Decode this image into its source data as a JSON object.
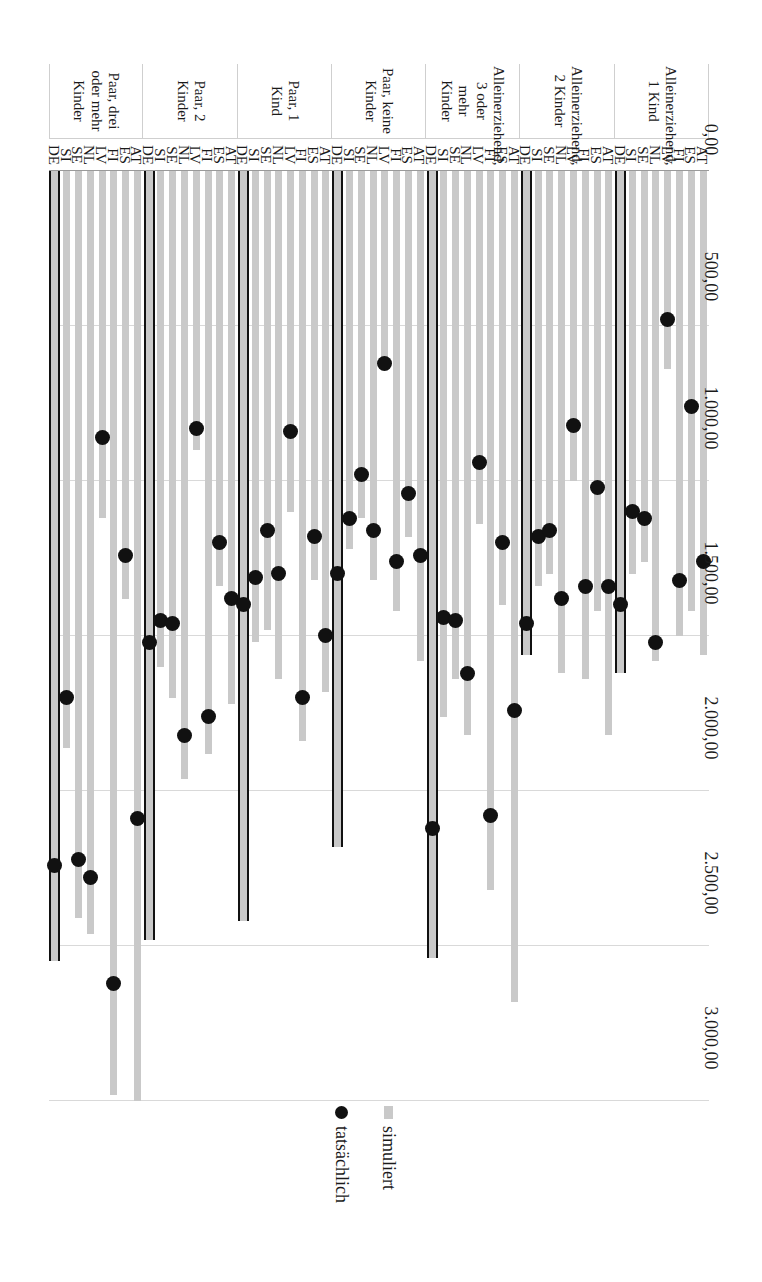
{
  "chart_data": {
    "type": "bar",
    "title": "",
    "xlabel": "",
    "ylabel": "",
    "orientation": "horizontal-rotated-90",
    "xlim": [
      0,
      3000
    ],
    "grid": true,
    "axis_ticks": [
      "3.000,00",
      "2.500,00",
      "2.000,00",
      "1.500,00",
      "1.000,00",
      "500,00",
      "0,00"
    ],
    "axis_tick_values": [
      3000,
      2500,
      2000,
      1500,
      1000,
      500,
      0
    ],
    "legend_position": "right",
    "legend": [
      {
        "label": "simuliert",
        "marker": "square",
        "color": "#c9c9c9"
      },
      {
        "label": "tatsächlich",
        "marker": "circle",
        "color": "#111111"
      }
    ],
    "series": [
      {
        "name": "simuliert",
        "type": "bar"
      },
      {
        "name": "tatsächlich",
        "type": "scatter"
      }
    ],
    "countries": [
      "DE",
      "SI",
      "SE",
      "NL",
      "LV",
      "FI",
      "ES",
      "AT"
    ],
    "groups": [
      {
        "label": "Paar, drei oder mehr Kinder",
        "rows": [
          {
            "country": "DE",
            "simuliert": 2550,
            "tatsaechlich": 2240,
            "highlight": true
          },
          {
            "country": "SI",
            "simuliert": 1860,
            "tatsaechlich": 1700
          },
          {
            "country": "SE",
            "simuliert": 2410,
            "tatsaechlich": 2220
          },
          {
            "country": "NL",
            "simuliert": 2460,
            "tatsaechlich": 2280
          },
          {
            "country": "LV",
            "simuliert": 1120,
            "tatsaechlich": 860
          },
          {
            "country": "FI",
            "simuliert": 2980,
            "tatsaechlich": 2620
          },
          {
            "country": "ES",
            "simuliert": 1380,
            "tatsaechlich": 1240
          },
          {
            "country": "AT",
            "simuliert": 3000,
            "tatsaechlich": 2090
          }
        ]
      },
      {
        "label": "Paar, 2 Kinder",
        "rows": [
          {
            "country": "DE",
            "simuliert": 2480,
            "tatsaechlich": 1520,
            "highlight": true
          },
          {
            "country": "SI",
            "simuliert": 1600,
            "tatsaechlich": 1450
          },
          {
            "country": "SE",
            "simuliert": 1700,
            "tatsaechlich": 1460
          },
          {
            "country": "NL",
            "simuliert": 1960,
            "tatsaechlich": 1820
          },
          {
            "country": "LV",
            "simuliert": 900,
            "tatsaechlich": 830
          },
          {
            "country": "FI",
            "simuliert": 1880,
            "tatsaechlich": 1760
          },
          {
            "country": "ES",
            "simuliert": 1340,
            "tatsaechlich": 1200
          },
          {
            "country": "AT",
            "simuliert": 1720,
            "tatsaechlich": 1380
          }
        ]
      },
      {
        "label": "Paar, 1 Kind",
        "rows": [
          {
            "country": "DE",
            "simuliert": 2420,
            "tatsaechlich": 1400,
            "highlight": true
          },
          {
            "country": "SI",
            "simuliert": 1520,
            "tatsaechlich": 1310
          },
          {
            "country": "SE",
            "simuliert": 1480,
            "tatsaechlich": 1160
          },
          {
            "country": "NL",
            "simuliert": 1640,
            "tatsaechlich": 1300
          },
          {
            "country": "LV",
            "simuliert": 1100,
            "tatsaechlich": 840
          },
          {
            "country": "FI",
            "simuliert": 1840,
            "tatsaechlich": 1700
          },
          {
            "country": "ES",
            "simuliert": 1320,
            "tatsaechlich": 1180
          },
          {
            "country": "AT",
            "simuliert": 1680,
            "tatsaechlich": 1500
          }
        ]
      },
      {
        "label": "Paar, keine Kinder",
        "rows": [
          {
            "country": "DE",
            "simuliert": 2180,
            "tatsaechlich": 1300,
            "highlight": true
          },
          {
            "country": "SI",
            "simuliert": 1220,
            "tatsaechlich": 1120
          },
          {
            "country": "SE",
            "simuliert": 1120,
            "tatsaechlich": 980
          },
          {
            "country": "NL",
            "simuliert": 1320,
            "tatsaechlich": 1160
          },
          {
            "country": "LV",
            "simuliert": 640,
            "tatsaechlich": 620
          },
          {
            "country": "FI",
            "simuliert": 1420,
            "tatsaechlich": 1260
          },
          {
            "country": "ES",
            "simuliert": 1180,
            "tatsaechlich": 1040
          },
          {
            "country": "AT",
            "simuliert": 1580,
            "tatsaechlich": 1240
          }
        ]
      },
      {
        "label": "Alleinerziehend, 3 oder mehr Kinder",
        "rows": [
          {
            "country": "DE",
            "simuliert": 2540,
            "tatsaechlich": 2120,
            "highlight": true
          },
          {
            "country": "SI",
            "simuliert": 1760,
            "tatsaechlich": 1440
          },
          {
            "country": "SE",
            "simuliert": 1640,
            "tatsaechlich": 1450
          },
          {
            "country": "NL",
            "simuliert": 1820,
            "tatsaechlich": 1620
          },
          {
            "country": "LV",
            "simuliert": 1140,
            "tatsaechlich": 940
          },
          {
            "country": "FI",
            "simuliert": 2320,
            "tatsaechlich": 2080
          },
          {
            "country": "ES",
            "simuliert": 1400,
            "tatsaechlich": 1200
          },
          {
            "country": "AT",
            "simuliert": 2680,
            "tatsaechlich": 1740
          }
        ]
      },
      {
        "label": "Alleinerziehend, 2 Kinder",
        "rows": [
          {
            "country": "DE",
            "simuliert": 1560,
            "tatsaechlich": 1460,
            "highlight": true
          },
          {
            "country": "SI",
            "simuliert": 1340,
            "tatsaechlich": 1180
          },
          {
            "country": "SE",
            "simuliert": 1300,
            "tatsaechlich": 1160
          },
          {
            "country": "NL",
            "simuliert": 1620,
            "tatsaechlich": 1380
          },
          {
            "country": "LV",
            "simuliert": 1000,
            "tatsaechlich": 820
          },
          {
            "country": "FI",
            "simuliert": 1640,
            "tatsaechlich": 1340
          },
          {
            "country": "ES",
            "simuliert": 1420,
            "tatsaechlich": 1020
          },
          {
            "country": "AT",
            "simuliert": 1820,
            "tatsaechlich": 1340
          }
        ]
      },
      {
        "label": "Alleinerziehend, 1 Kind",
        "rows": [
          {
            "country": "DE",
            "simuliert": 1620,
            "tatsaechlich": 1400,
            "highlight": true
          },
          {
            "country": "SI",
            "simuliert": 1300,
            "tatsaechlich": 1100
          },
          {
            "country": "SE",
            "simuliert": 1260,
            "tatsaechlich": 1120
          },
          {
            "country": "NL",
            "simuliert": 1580,
            "tatsaechlich": 1520
          },
          {
            "country": "LV",
            "simuliert": 640,
            "tatsaechlich": 480
          },
          {
            "country": "FI",
            "simuliert": 1500,
            "tatsaechlich": 1320
          },
          {
            "country": "ES",
            "simuliert": 1420,
            "tatsaechlich": 760
          },
          {
            "country": "AT",
            "simuliert": 1560,
            "tatsaechlich": 1260
          }
        ]
      }
    ]
  }
}
